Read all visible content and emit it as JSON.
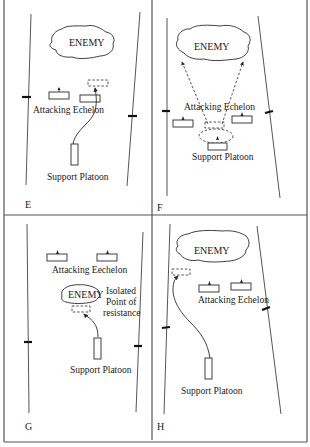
{
  "figure": {
    "panels": [
      {
        "id": "E",
        "letter": "E",
        "enemy_label": "ENEMY",
        "attacking_label": "Attacking Echelon",
        "support_label": "Support Platoon"
      },
      {
        "id": "F",
        "letter": "F",
        "enemy_label": "ENEMY",
        "attacking_label": "Attacking Echelon",
        "support_label": "Support Platoon"
      },
      {
        "id": "G",
        "letter": "G",
        "enemy_label": "ENEMY",
        "attacking_label": "Attacking Eechelon",
        "support_label": "Support Platoon",
        "isolated_label_line1": "Isolated",
        "isolated_label_line2": "Point of",
        "isolated_label_line3": "resistance"
      },
      {
        "id": "H",
        "letter": "H",
        "enemy_label": "ENEMY",
        "attacking_label": "Attacking Echelon",
        "support_label": "Support Platoon"
      }
    ]
  }
}
